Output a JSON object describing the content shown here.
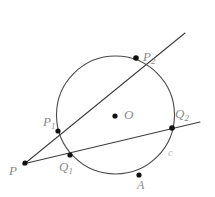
{
  "figure": {
    "kind": "euclidean-geometry-diagram",
    "background_color": "#ffffff",
    "stroke_color": "#3c3c3c",
    "circle_stroke_color": "#4a4a4a",
    "point_fill_color": "#111111",
    "label_color": "#8a8a8a",
    "faint_label_color": "#b2b2b2",
    "width": 215,
    "height": 197
  },
  "circle": {
    "name": "c",
    "center_label": "O",
    "cx": 115.5,
    "cy": 115,
    "r": 59,
    "stroke_width": 1.1
  },
  "points": [
    {
      "id": "P",
      "label": "P",
      "sub": "",
      "x": 25,
      "y": 163,
      "r": 2.6,
      "role": "external-point"
    },
    {
      "id": "Q1",
      "label": "Q",
      "sub": "1",
      "x": 70,
      "y": 155,
      "r": 2.6,
      "role": "secant-2-near-intersection"
    },
    {
      "id": "P1",
      "label": "P",
      "sub": "1",
      "x": 58,
      "y": 131,
      "r": 2.6,
      "role": "secant-1-near-intersection"
    },
    {
      "id": "P2",
      "label": "P",
      "sub": "2",
      "x": 136,
      "y": 58,
      "r": 2.8,
      "role": "secant-1-far-intersection"
    },
    {
      "id": "Q2",
      "label": "Q",
      "sub": "2",
      "x": 172,
      "y": 128,
      "r": 2.8,
      "role": "secant-2-far-intersection"
    },
    {
      "id": "O",
      "label": "O",
      "sub": "",
      "x": 115,
      "y": 116,
      "r": 2.6,
      "role": "circle-center"
    },
    {
      "id": "A",
      "label": "A",
      "sub": "",
      "x": 139,
      "y": 175,
      "r": 2.6,
      "role": "point-on-circle"
    }
  ],
  "lines": [
    {
      "id": "secant-1",
      "description": "Secant through P, P1 and P2",
      "x1": 23,
      "y1": 165,
      "x2": 185,
      "y2": 33,
      "stroke_width": 1.05
    },
    {
      "id": "secant-2",
      "description": "Secant through P, Q1 and Q2",
      "x1": 23,
      "y1": 164,
      "x2": 200,
      "y2": 122,
      "stroke_width": 1.05
    }
  ],
  "labels": {
    "P": "P",
    "Q1_base": "Q",
    "Q1_sub": "1",
    "P1_base": "P",
    "P1_sub": "1",
    "P2_base": "P",
    "P2_sub": "2",
    "Q2_base": "Q",
    "Q2_sub": "2",
    "O": "O",
    "A": "A",
    "c": "c"
  }
}
